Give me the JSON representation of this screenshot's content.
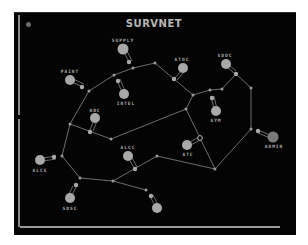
{
  "title": "SURVNET",
  "colors": {
    "background": "#040404",
    "node": "#a8a8a8",
    "link": "#9a9a9a",
    "admin_node": "#7a7a7a",
    "label": "#b0b0b0"
  },
  "stations": [
    {
      "id": "supply",
      "label": "SUPPLY"
    },
    {
      "id": "paint",
      "label": "PAINT"
    },
    {
      "id": "intel",
      "label": "INTEL"
    },
    {
      "id": "atoc",
      "label": "ATOC"
    },
    {
      "id": "sdoc",
      "label": "SDOC"
    },
    {
      "id": "gym",
      "label": "GYM"
    },
    {
      "id": "hoc",
      "label": "HOC"
    },
    {
      "id": "admin",
      "label": "ADMIN"
    },
    {
      "id": "atc",
      "label": "ATC"
    },
    {
      "id": "alcc",
      "label": "ALCC"
    },
    {
      "id": "alce",
      "label": "ALCE"
    },
    {
      "id": "sdsc",
      "label": "SDSC"
    },
    {
      "id": "unlabeled",
      "label": ""
    }
  ]
}
